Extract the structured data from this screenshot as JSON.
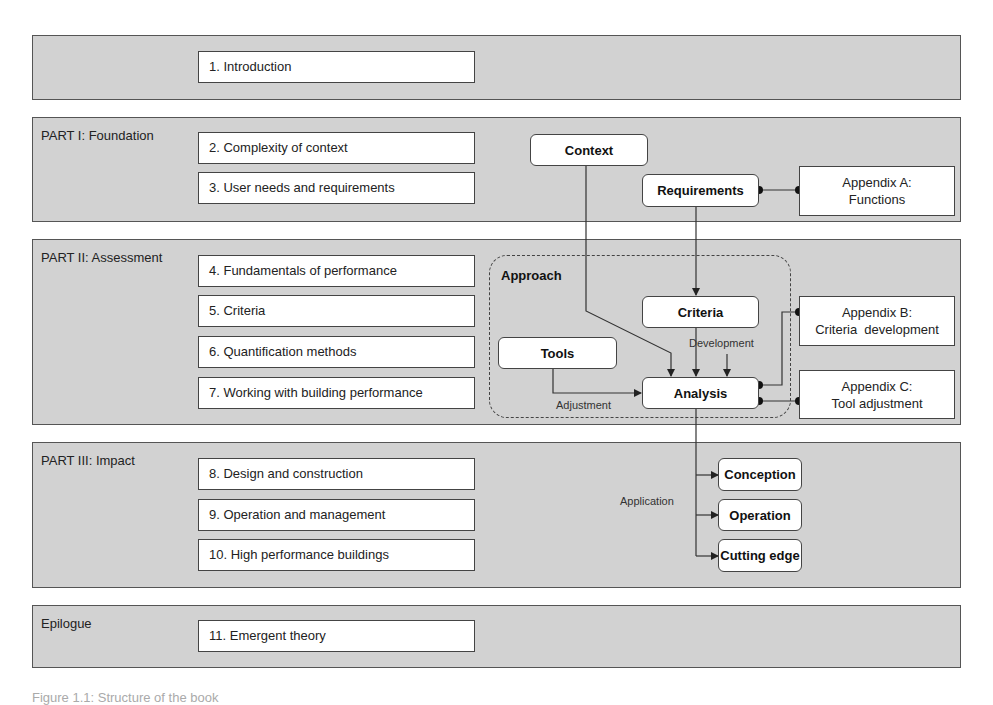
{
  "bands": [
    {
      "label": "",
      "chapters": [
        "1. Introduction"
      ]
    },
    {
      "label": "PART I: Foundation",
      "chapters": [
        "2. Complexity of context",
        "3. User needs and requirements"
      ]
    },
    {
      "label": "PART II: Assessment",
      "chapters": [
        "4.  Fundamentals of performance",
        "5. Criteria",
        "6. Quantification methods",
        "7.  Working with building performance"
      ]
    },
    {
      "label": "PART III: Impact",
      "chapters": [
        "8. Design and construction",
        "9. Operation and management",
        "10. High performance buildings"
      ]
    },
    {
      "label": "Epilogue",
      "chapters": [
        "11. Emergent theory"
      ]
    }
  ],
  "diagram": {
    "nodes": {
      "context": "Context",
      "requirements": "Requirements",
      "criteria": "Criteria",
      "tools": "Tools",
      "analysis": "Analysis",
      "conception": "Conception",
      "operation": "Operation",
      "cutting_edge": "Cutting edge"
    },
    "group_label": "Approach",
    "edge_labels": {
      "development": "Development",
      "adjustment": "Adjustment",
      "application": "Application"
    },
    "appendices": {
      "a": {
        "line1": "Appendix A:",
        "line2": "Functions"
      },
      "b": {
        "line1": "Appendix B:",
        "line2": "Criteria  development"
      },
      "c": {
        "line1": "Appendix C:",
        "line2": "Tool adjustment"
      }
    }
  },
  "caption": "Figure 1.1: Structure of the book"
}
